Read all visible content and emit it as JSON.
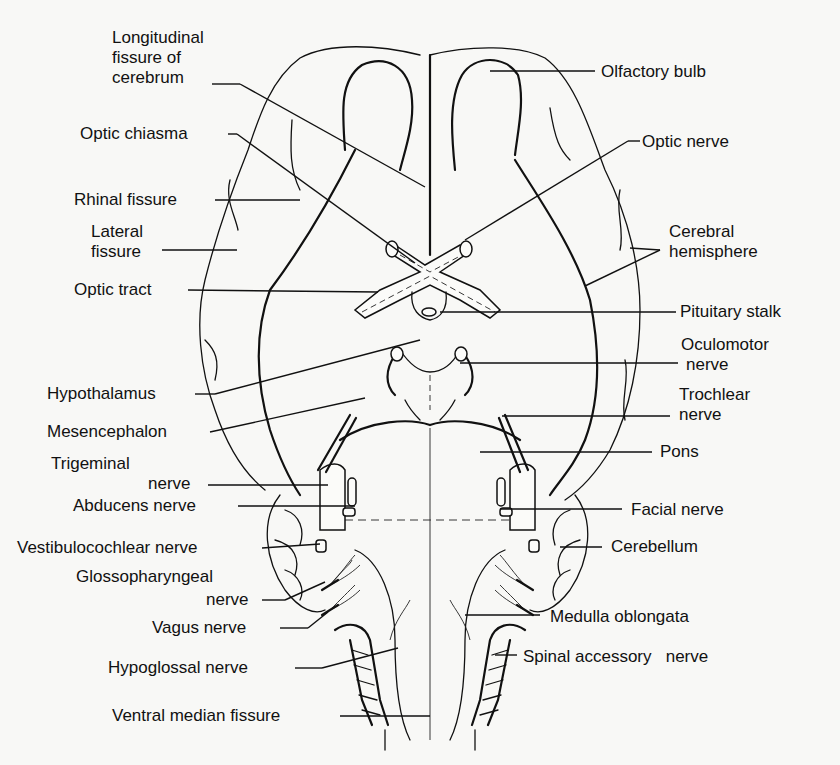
{
  "diagram": {
    "left_labels": [
      {
        "id": "longitudinal-fissure",
        "lines": [
          "Longitudinal",
          "fissure of",
          "cerebrum"
        ]
      },
      {
        "id": "optic-chiasma",
        "lines": [
          "Optic chiasma"
        ]
      },
      {
        "id": "rhinal-fissure",
        "lines": [
          "Rhinal fissure"
        ]
      },
      {
        "id": "lateral-fissure",
        "lines": [
          "Lateral",
          "fissure"
        ]
      },
      {
        "id": "optic-tract",
        "lines": [
          "Optic tract"
        ]
      },
      {
        "id": "hypothalamus",
        "lines": [
          "Hypothalamus"
        ]
      },
      {
        "id": "mesencephalon",
        "lines": [
          "Mesencephalon"
        ]
      },
      {
        "id": "trigeminal-nerve",
        "lines": [
          "Trigeminal",
          "nerve"
        ]
      },
      {
        "id": "abducens-nerve",
        "lines": [
          "Abducens nerve"
        ]
      },
      {
        "id": "vestibulocochlear-nerve",
        "lines": [
          "Vestibulocochlear nerve"
        ]
      },
      {
        "id": "glossopharyngeal-nerve",
        "lines": [
          "Glossopharyngeal",
          "nerve"
        ]
      },
      {
        "id": "vagus-nerve",
        "lines": [
          "Vagus nerve"
        ]
      },
      {
        "id": "hypoglossal-nerve",
        "lines": [
          "Hypoglossal nerve"
        ]
      },
      {
        "id": "ventral-median-fissure",
        "lines": [
          "Ventral median fissure"
        ]
      }
    ],
    "right_labels": [
      {
        "id": "olfactory-bulb",
        "lines": [
          "Olfactory bulb"
        ]
      },
      {
        "id": "optic-nerve",
        "lines": [
          "Optic nerve"
        ]
      },
      {
        "id": "cerebral-hemisphere",
        "lines": [
          "Cerebral",
          "hemisphere"
        ]
      },
      {
        "id": "pituitary-stalk",
        "lines": [
          "Pituitary stalk"
        ]
      },
      {
        "id": "oculomotor-nerve",
        "lines": [
          "Oculomotor",
          "nerve"
        ]
      },
      {
        "id": "trochlear-nerve",
        "lines": [
          "Trochlear",
          "nerve"
        ]
      },
      {
        "id": "pons",
        "lines": [
          "Pons"
        ]
      },
      {
        "id": "facial-nerve",
        "lines": [
          "Facial nerve"
        ]
      },
      {
        "id": "cerebellum",
        "lines": [
          "Cerebellum"
        ]
      },
      {
        "id": "medulla-oblongata",
        "lines": [
          "Medulla oblongata"
        ]
      },
      {
        "id": "spinal-accessory-nerve",
        "lines": [
          "Spinal accessory   nerve"
        ]
      }
    ]
  }
}
